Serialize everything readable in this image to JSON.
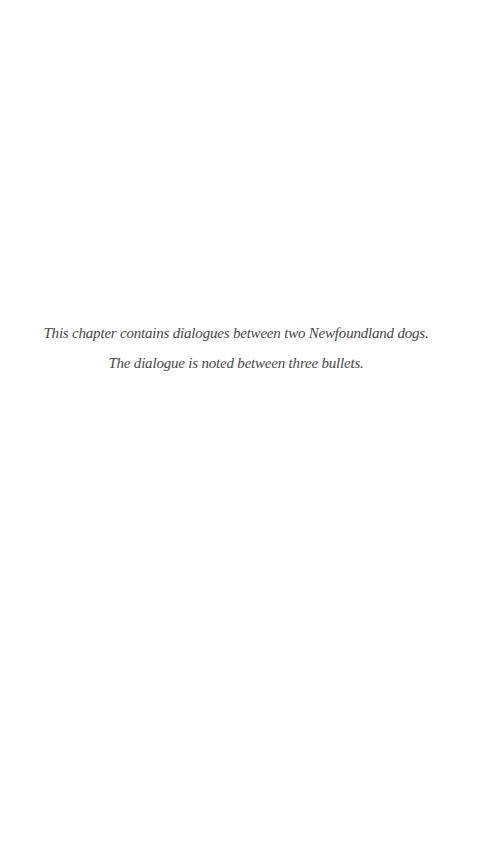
{
  "page": {
    "background_color": "#ffffff",
    "text_color": "#474747",
    "note": {
      "lines": [
        "This chapter contains dialogues between two Newfoundland dogs.",
        "The dialogue is noted between three bullets."
      ]
    }
  }
}
